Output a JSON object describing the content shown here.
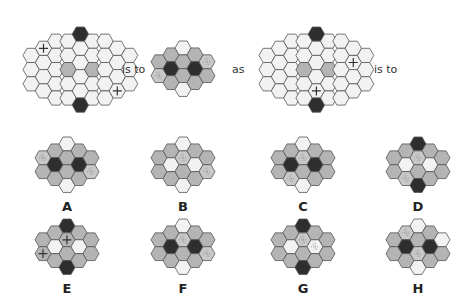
{
  "colors": {
    "white": "#f2f2f2",
    "gray": "#b4b4b4",
    "dark": "#2e2e2e",
    "stroke": "#555555",
    "pattern": "#c8c8c8",
    "cross_bg": "#f2f2f2",
    "cross_gray": "#b4b4b4"
  },
  "question": {
    "words": [
      "is to",
      "as",
      "is to"
    ],
    "grids": [
      {
        "id": "q1",
        "x": 22,
        "y": 26,
        "hex": 8.2,
        "cols": [
          [
            "w",
            "w",
            "w"
          ],
          [
            "c",
            "w",
            "w",
            "w"
          ],
          [
            "w",
            "w",
            "w",
            "w",
            "w"
          ],
          [
            "w",
            "w",
            "g",
            "w",
            "w"
          ],
          [
            "d",
            "w",
            "w",
            "w",
            "w",
            "d"
          ],
          [
            "w",
            "w",
            "g",
            "w",
            "w"
          ],
          [
            "w",
            "w",
            "w",
            "w",
            "w"
          ],
          [
            "w",
            "w",
            "w",
            "c"
          ],
          [
            "w",
            "w",
            "w"
          ]
        ]
      },
      {
        "id": "q2",
        "x": 150,
        "y": 40,
        "hex": 8,
        "cols": [
          [
            "g",
            "p"
          ],
          [
            "g",
            "d",
            "g"
          ],
          [
            "w",
            "g",
            "g",
            "w"
          ],
          [
            "g",
            "d",
            "g"
          ],
          [
            "p",
            "g"
          ]
        ]
      },
      {
        "id": "q3",
        "x": 258,
        "y": 26,
        "hex": 8.2,
        "cols": [
          [
            "w",
            "w",
            "w"
          ],
          [
            "w",
            "w",
            "w",
            "w"
          ],
          [
            "w",
            "w",
            "w",
            "w",
            "w"
          ],
          [
            "w",
            "w",
            "g",
            "w",
            "w"
          ],
          [
            "d",
            "w",
            "w",
            "w",
            "c",
            "d"
          ],
          [
            "w",
            "w",
            "g",
            "w",
            "w"
          ],
          [
            "w",
            "w",
            "w",
            "w",
            "w"
          ],
          [
            "w",
            "c",
            "w",
            "w"
          ],
          [
            "w",
            "w",
            "w"
          ]
        ]
      }
    ]
  },
  "options": [
    {
      "label": "A",
      "x": 34,
      "y": 136,
      "cols": [
        [
          "p",
          "g"
        ],
        [
          "g",
          "d",
          "g"
        ],
        [
          "w",
          "g",
          "g",
          "w"
        ],
        [
          "g",
          "d",
          "g"
        ],
        [
          "g",
          "p"
        ]
      ]
    },
    {
      "label": "B",
      "x": 150,
      "y": 136,
      "cols": [
        [
          "g",
          "g"
        ],
        [
          "g",
          "w",
          "g"
        ],
        [
          "w",
          "p",
          "g",
          "w"
        ],
        [
          "g",
          "w",
          "g"
        ],
        [
          "g",
          "p"
        ]
      ]
    },
    {
      "label": "C",
      "x": 270,
      "y": 136,
      "cols": [
        [
          "g",
          "g"
        ],
        [
          "g",
          "d",
          "p"
        ],
        [
          "w",
          "p",
          "g",
          "w"
        ],
        [
          "g",
          "d",
          "g"
        ],
        [
          "g",
          "g"
        ]
      ]
    },
    {
      "label": "D",
      "x": 385,
      "y": 136,
      "cols": [
        [
          "g",
          "g"
        ],
        [
          "g",
          "w",
          "p"
        ],
        [
          "d",
          "p",
          "g",
          "d"
        ],
        [
          "g",
          "w",
          "g"
        ],
        [
          "g",
          "g"
        ]
      ]
    },
    {
      "label": "E",
      "x": 34,
      "y": 218,
      "cols": [
        [
          "g",
          "x"
        ],
        [
          "g",
          "w",
          "g"
        ],
        [
          "d",
          "x",
          "g",
          "d"
        ],
        [
          "g",
          "w",
          "g"
        ],
        [
          "g",
          "g"
        ]
      ]
    },
    {
      "label": "F",
      "x": 150,
      "y": 218,
      "cols": [
        [
          "g",
          "g"
        ],
        [
          "g",
          "d",
          "g"
        ],
        [
          "w",
          "p",
          "g",
          "w"
        ],
        [
          "g",
          "d",
          "g"
        ],
        [
          "g",
          "p"
        ]
      ]
    },
    {
      "label": "G",
      "x": 270,
      "y": 218,
      "cols": [
        [
          "g",
          "g"
        ],
        [
          "g",
          "w",
          "g"
        ],
        [
          "d",
          "p",
          "g",
          "d"
        ],
        [
          "g",
          "q",
          "g"
        ],
        [
          "g",
          "g"
        ]
      ]
    },
    {
      "label": "H",
      "x": 385,
      "y": 218,
      "cols": [
        [
          "g",
          "g"
        ],
        [
          "p",
          "d",
          "g"
        ],
        [
          "w",
          "g",
          "p",
          "w"
        ],
        [
          "g",
          "d",
          "g"
        ],
        [
          "w",
          "g"
        ]
      ]
    }
  ],
  "word_positions": [
    {
      "x": 122,
      "y": 63
    },
    {
      "x": 232,
      "y": 63
    },
    {
      "x": 374,
      "y": 63
    }
  ]
}
